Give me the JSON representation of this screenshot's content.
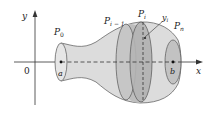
{
  "figure": {
    "type": "surface-of-revolution",
    "axes": {
      "x_label": "x",
      "y_label": "y",
      "origin_label": "0"
    },
    "interval": {
      "left_label": "a",
      "right_label": "b"
    },
    "points": {
      "p0": "P",
      "p0_sub": "0",
      "pim1": "P",
      "pim1_sub": "i − 1",
      "pi": "P",
      "pi_sub": "i",
      "pn": "P",
      "pn_sub": "n"
    },
    "radius_label": "y",
    "radius_sub": "i",
    "colors": {
      "surface_fill": "#d9d9d9",
      "band_fill": "#b8b8b8",
      "outline": "#555555",
      "axis": "#333333"
    }
  }
}
